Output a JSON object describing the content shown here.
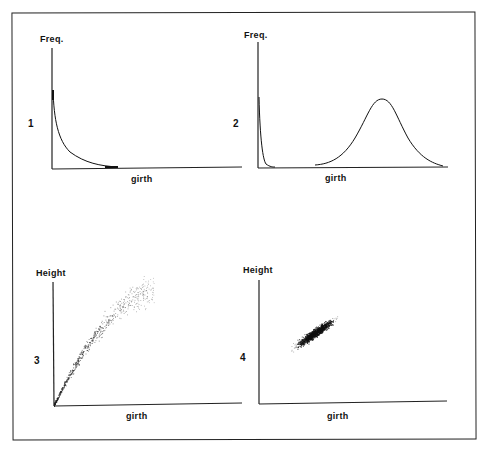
{
  "chart_data": [
    {
      "panel": "1",
      "type": "line",
      "ylabel": "Freq.",
      "xlabel": "girth",
      "description": "Steeply decaying (reverse-J) frequency distribution of girth",
      "series": [
        {
          "name": "frequency",
          "x": [
            0,
            2,
            5,
            10,
            20,
            30,
            40,
            50,
            60,
            100
          ],
          "values": [
            100,
            70,
            48,
            30,
            14,
            6,
            2,
            0.5,
            0,
            0
          ]
        }
      ]
    },
    {
      "panel": "2",
      "type": "line",
      "ylabel": "Freq.",
      "xlabel": "girth",
      "description": "Sharp narrow peak near origin plus a broad bell-shaped distribution at larger girth",
      "series": [
        {
          "name": "small-girth peak",
          "x": [
            0,
            2,
            5,
            10,
            15
          ],
          "values": [
            100,
            60,
            20,
            4,
            0
          ]
        },
        {
          "name": "large-girth bell",
          "x": [
            30,
            40,
            50,
            60,
            65,
            70,
            80,
            90,
            100
          ],
          "values": [
            0,
            8,
            35,
            72,
            78,
            72,
            35,
            8,
            0
          ]
        }
      ]
    },
    {
      "panel": "3",
      "type": "scatter",
      "ylabel": "Height",
      "xlabel": "girth",
      "description": "Dense cluster at origin fanning out into a widening, sparser curved band (height vs girth)"
    },
    {
      "panel": "4",
      "type": "scatter",
      "ylabel": "Height",
      "xlabel": "girth",
      "description": "Tight, dense elongated elliptical cluster with positive correlation, center mid-range"
    }
  ],
  "panels": {
    "p1": {
      "number": "1",
      "ylabel": "Freq.",
      "xlabel": "girth"
    },
    "p2": {
      "number": "2",
      "ylabel": "Freq.",
      "xlabel": "girth"
    },
    "p3": {
      "number": "3",
      "ylabel": "Height",
      "xlabel": "girth"
    },
    "p4": {
      "number": "4",
      "ylabel": "Height",
      "xlabel": "girth"
    }
  }
}
